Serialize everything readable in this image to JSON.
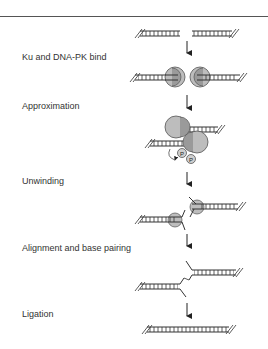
{
  "diagram": {
    "steps": [
      {
        "label": "Ku and DNA-PK bind"
      },
      {
        "label": "Approximation"
      },
      {
        "label": "Unwinding"
      },
      {
        "label": "Alignment and base pairing"
      },
      {
        "label": "Ligation"
      }
    ],
    "phosphate_label": "P",
    "colors": {
      "line": "#333333",
      "protein_fill": "#bdbdbd",
      "protein_dark": "#8f8f8f",
      "background": "#ffffff"
    }
  }
}
